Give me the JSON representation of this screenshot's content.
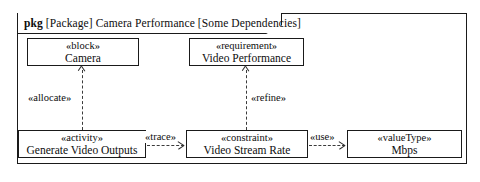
{
  "package": {
    "keyword": "pkg",
    "qualifier": "[Package]",
    "name": "Camera Performance",
    "view": "[Some Dependencies]"
  },
  "nodes": [
    {
      "id": "block",
      "stereotype": "«block»",
      "name": "Camera"
    },
    {
      "id": "requirement",
      "stereotype": "«requirement»",
      "name": "Video Performance"
    },
    {
      "id": "activity",
      "stereotype": "«activity»",
      "name": "Generate Video Outputs"
    },
    {
      "id": "constraint",
      "stereotype": "«constraint»",
      "name": "Video Stream Rate"
    },
    {
      "id": "valuetype",
      "stereotype": "«valueType»",
      "name": "Mbps"
    }
  ],
  "edges": [
    {
      "id": "allocate",
      "label": "«allocate»",
      "from": "activity",
      "to": "block",
      "style": "dashed",
      "direction": "up"
    },
    {
      "id": "refine",
      "label": "«refine»",
      "from": "constraint",
      "to": "requirement",
      "style": "dashed",
      "direction": "up"
    },
    {
      "id": "trace",
      "label": "«trace»",
      "from": "activity",
      "to": "constraint",
      "style": "dashed",
      "direction": "right"
    },
    {
      "id": "use",
      "label": "«use»",
      "from": "constraint",
      "to": "valuetype",
      "style": "dashed",
      "direction": "right"
    }
  ],
  "colors": {
    "line": "#1a1a1a",
    "dashed_line": "#3b3b3b",
    "text": "#0d0d0d",
    "background": "#ffffff"
  }
}
